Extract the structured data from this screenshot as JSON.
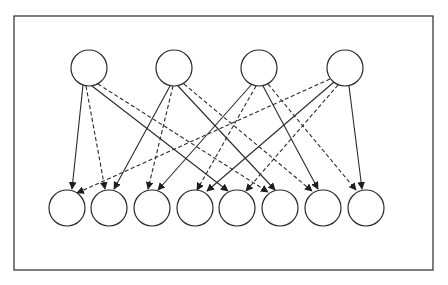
{
  "diagram": {
    "type": "bipartite-directed-graph",
    "frame": {
      "x": 14,
      "y": 16,
      "width": 198,
      "height": 114
    },
    "colors": {
      "stroke": "#2a2a2a",
      "background": "#ffffff"
    },
    "node_radius": 18,
    "top_nodes": [
      {
        "id": "T1",
        "cx": 89,
        "cy": 68
      },
      {
        "id": "T2",
        "cx": 174,
        "cy": 68
      },
      {
        "id": "T3",
        "cx": 259,
        "cy": 68
      },
      {
        "id": "T4",
        "cx": 345,
        "cy": 68
      }
    ],
    "bottom_nodes": [
      {
        "id": "B1",
        "cx": 67,
        "cy": 208
      },
      {
        "id": "B2",
        "cx": 109,
        "cy": 208
      },
      {
        "id": "B3",
        "cx": 152,
        "cy": 208
      },
      {
        "id": "B4",
        "cx": 195,
        "cy": 208
      },
      {
        "id": "B5",
        "cx": 237,
        "cy": 208
      },
      {
        "id": "B6",
        "cx": 280,
        "cy": 208
      },
      {
        "id": "B7",
        "cx": 323,
        "cy": 208
      },
      {
        "id": "B8",
        "cx": 366,
        "cy": 208
      }
    ],
    "edges": [
      {
        "from": "T1",
        "to": "B1",
        "style": "solid",
        "x1": 83,
        "y1": 85,
        "x2": 72,
        "y2": 189
      },
      {
        "from": "T1",
        "to": "B2",
        "style": "dashed",
        "x1": 86,
        "y1": 86,
        "x2": 105,
        "y2": 189
      },
      {
        "from": "T1",
        "to": "B5",
        "style": "solid",
        "x1": 92,
        "y1": 86,
        "x2": 228,
        "y2": 191
      },
      {
        "from": "T1",
        "to": "B6",
        "style": "dashed",
        "x1": 98,
        "y1": 84,
        "x2": 268,
        "y2": 192
      },
      {
        "from": "T2",
        "to": "B2",
        "style": "solid",
        "x1": 170,
        "y1": 86,
        "x2": 114,
        "y2": 189
      },
      {
        "from": "T2",
        "to": "B3",
        "style": "dashed",
        "x1": 173,
        "y1": 86,
        "x2": 148,
        "y2": 189
      },
      {
        "from": "T2",
        "to": "B6",
        "style": "solid",
        "x1": 178,
        "y1": 86,
        "x2": 275,
        "y2": 190
      },
      {
        "from": "T2",
        "to": "B7",
        "style": "dashed",
        "x1": 184,
        "y1": 84,
        "x2": 312,
        "y2": 191
      },
      {
        "from": "T3",
        "to": "B3",
        "style": "solid",
        "x1": 252,
        "y1": 84,
        "x2": 158,
        "y2": 190
      },
      {
        "from": "T3",
        "to": "B4",
        "style": "dashed",
        "x1": 256,
        "y1": 86,
        "x2": 197,
        "y2": 190
      },
      {
        "from": "T3",
        "to": "B7",
        "style": "solid",
        "x1": 263,
        "y1": 86,
        "x2": 318,
        "y2": 189
      },
      {
        "from": "T3",
        "to": "B8",
        "style": "dashed",
        "x1": 268,
        "y1": 84,
        "x2": 356,
        "y2": 190
      },
      {
        "from": "T4",
        "to": "B1",
        "style": "dashed",
        "x1": 330,
        "y1": 79,
        "x2": 77,
        "y2": 193
      },
      {
        "from": "T4",
        "to": "B4",
        "style": "solid",
        "x1": 334,
        "y1": 82,
        "x2": 207,
        "y2": 191
      },
      {
        "from": "T4",
        "to": "B5",
        "style": "dashed",
        "x1": 338,
        "y1": 85,
        "x2": 246,
        "y2": 191
      },
      {
        "from": "T4",
        "to": "B8",
        "style": "solid",
        "x1": 349,
        "y1": 86,
        "x2": 362,
        "y2": 189
      }
    ]
  }
}
